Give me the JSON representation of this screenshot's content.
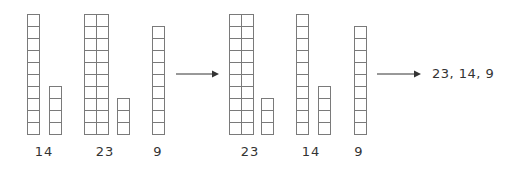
{
  "diagram": {
    "cell_size": 12,
    "stroke_color": "#7a7a7a",
    "arrow_color": "#333333",
    "stages": [
      {
        "name": "original",
        "groups": [
          {
            "label": "14",
            "tens": 1,
            "ones": 4
          },
          {
            "label": "23",
            "tens": 2,
            "ones": 3
          },
          {
            "label": "9",
            "tens": 0,
            "ones": 9
          }
        ]
      },
      {
        "name": "sorted",
        "groups": [
          {
            "label": "23",
            "tens": 2,
            "ones": 3
          },
          {
            "label": "14",
            "tens": 1,
            "ones": 4
          },
          {
            "label": "9",
            "tens": 0,
            "ones": 9
          }
        ]
      }
    ],
    "arrows": [
      {
        "name": "arrow-to-sorted"
      },
      {
        "name": "arrow-to-result"
      }
    ],
    "result_text": "23, 14, 9"
  }
}
